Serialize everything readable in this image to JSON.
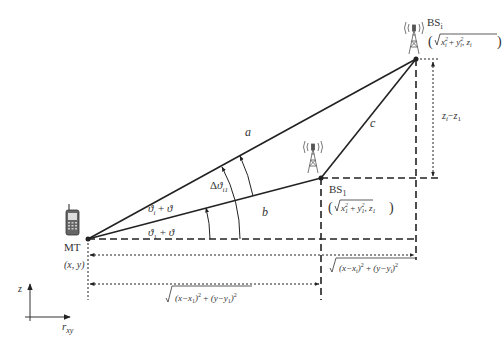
{
  "diagram": {
    "nodes": {
      "mt": {
        "label": "MT",
        "coords": "(x, y)"
      },
      "bs1": {
        "label": "BS",
        "sub": "1",
        "coords_x": "x",
        "coords_y": "y",
        "coords_z": "z",
        "idx": "1"
      },
      "bsi": {
        "label": "BS",
        "sub": "i",
        "coords_x": "x",
        "coords_y": "y",
        "coords_z": "z",
        "idx": "i"
      }
    },
    "edges": {
      "a": "a",
      "b": "b",
      "c": "c"
    },
    "angles": {
      "theta_i": {
        "theta": "ϑ",
        "sub": "i",
        "plus": "+",
        "theta2": "ϑ"
      },
      "theta_1": {
        "theta": "ϑ",
        "sub": "1",
        "plus": "+",
        "theta2": "ϑ"
      },
      "delta": {
        "delta": "Δ",
        "theta": "ϑ",
        "sub": "i1"
      }
    },
    "dimensions": {
      "height_diff": {
        "z": "z",
        "i": "i",
        "minus": "−",
        "one": "1"
      },
      "dist_i": {
        "part1": "(x−x",
        "sub1": "i",
        "part2": ")",
        "sq": "2",
        "plus": " + ",
        "part3": "(y−y",
        "sub2": "i",
        "part4": ")",
        "sq2": "2"
      },
      "dist_1": {
        "part1": "(x−x",
        "sub1": "1",
        "part2": ")",
        "sq": "2",
        "plus": " + ",
        "part3": "(y−y",
        "sub2": "1",
        "part4": ")",
        "sq2": "2"
      }
    },
    "axes": {
      "vertical": "z",
      "horizontal": "r",
      "horizontal_sub": "xy"
    }
  }
}
